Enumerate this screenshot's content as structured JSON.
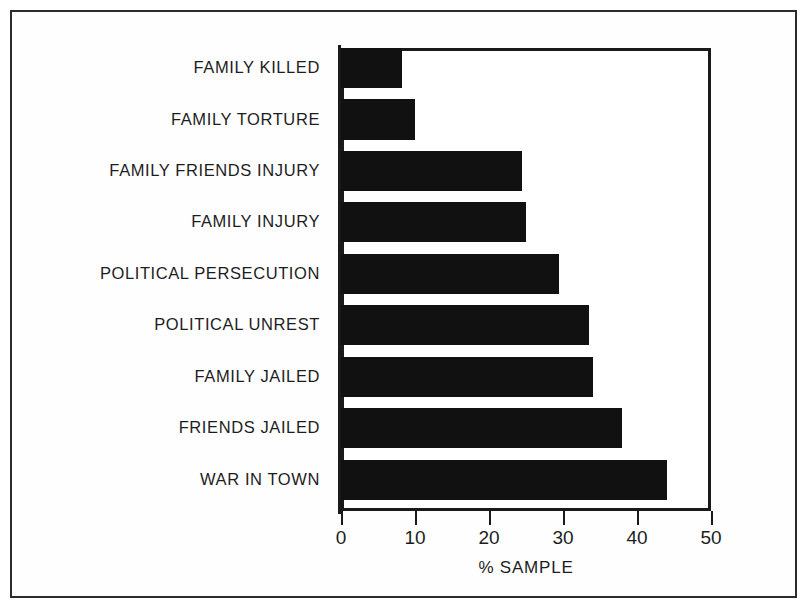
{
  "chart_data": {
    "type": "bar",
    "orientation": "horizontal",
    "title": "",
    "xlabel": "% SAMPLE",
    "ylabel": "",
    "xlim": [
      0,
      50
    ],
    "xticks": [
      "0",
      "10",
      "20",
      "30",
      "40",
      "50"
    ],
    "grid": false,
    "legend": null,
    "bar_color": "#111111",
    "categories": [
      "FAMILY KILLED",
      "FAMILY TORTURE",
      "FAMILY FRIENDS INJURY",
      "FAMILY INJURY",
      "POLITICAL PERSECUTION",
      "POLITICAL UNREST",
      "FAMILY JAILED",
      "FRIENDS JAILED",
      "WAR IN TOWN"
    ],
    "values": [
      8.3,
      10,
      24.5,
      25,
      29.5,
      33.5,
      34,
      38,
      44
    ]
  }
}
